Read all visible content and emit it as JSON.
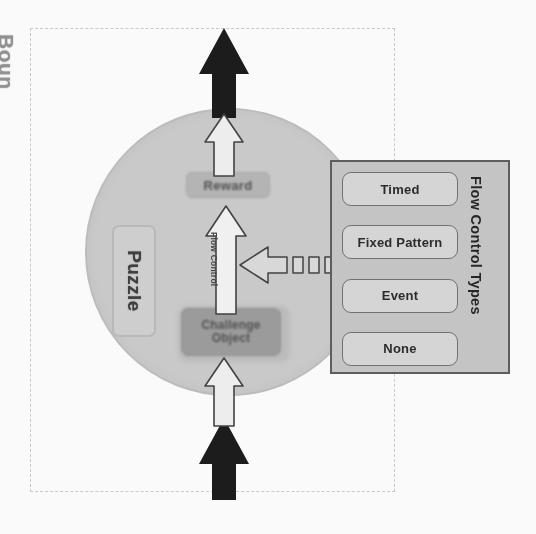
{
  "diagram": {
    "boundary": {
      "label": "Boun",
      "style": "dashed",
      "color": "#c9c9c9"
    },
    "system": {
      "shape": "circle",
      "fill": "#c9c9c9",
      "stroke": "#bcbcbc"
    },
    "puzzle": {
      "label": "Puzzle",
      "fill": "#cfcfcf",
      "stroke": "#b9b9b9"
    },
    "reward": {
      "label": "Reward",
      "fill": "#b4b4b4"
    },
    "challenge": {
      "line1": "Challenge",
      "line2": "Object",
      "fill": "#9a9a9a"
    },
    "flow_control_arrow": {
      "label": "Flow Control",
      "direction": "up"
    },
    "arrows": {
      "input_black": "input-flow-arrow",
      "output_black": "output-flow-arrow",
      "input_white": "internal-input-arrow",
      "output_white": "internal-output-arrow",
      "connector": "segmented-left-arrow"
    },
    "panel": {
      "title": "Flow Control Types",
      "fill": "#c4c4c4",
      "stroke": "#5a5a5a",
      "items": [
        {
          "label": "Timed"
        },
        {
          "label": "Fixed Pattern"
        },
        {
          "label": "Event"
        },
        {
          "label": "None"
        }
      ]
    }
  }
}
